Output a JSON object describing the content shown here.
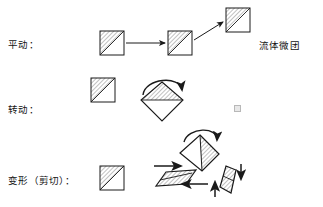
{
  "figure": {
    "type": "diagram",
    "background_color": "#ffffff",
    "stroke_color": "#1a1a1a",
    "hatch_color": "#8c8c8c"
  },
  "labels": {
    "translation": "平动：",
    "rotation": "转动：",
    "deformation": "变形（剪切）："
  },
  "caption": {
    "fluid_element": "流体微团"
  },
  "rows": [
    {
      "id": "translation",
      "label": "平动：",
      "description": "three identical hatched squares connected left-to-right by straight arrows",
      "shapes": [
        {
          "name": "square-start",
          "kind": "square",
          "x": 100,
          "y": 31,
          "size": 24,
          "hatched_half": "upper-left"
        },
        {
          "name": "square-middle",
          "kind": "square",
          "x": 168,
          "y": 31,
          "size": 24,
          "hatched_half": "upper-left"
        },
        {
          "name": "square-end",
          "kind": "square",
          "x": 226,
          "y": 8,
          "size": 24,
          "hatched_half": "upper-left"
        }
      ],
      "arrows": [
        {
          "name": "arrow-1",
          "kind": "straight",
          "from": [
            126,
            43
          ],
          "to": [
            166,
            43
          ]
        },
        {
          "name": "arrow-2",
          "kind": "straight",
          "from": [
            194,
            40
          ],
          "to": [
            224,
            22
          ]
        }
      ]
    },
    {
      "id": "rotation",
      "label": "转动：",
      "description": "a hatched square plus a rotated diamond with a clockwise curved arrow over it",
      "shapes": [
        {
          "name": "square-reference",
          "kind": "square",
          "x": 91,
          "y": 78,
          "size": 24,
          "hatched_half": "upper-left"
        },
        {
          "name": "diamond-rotated",
          "kind": "diamond",
          "cx": 162,
          "cy": 100,
          "rx": 21,
          "ry": 21,
          "hatched_half": "upper"
        }
      ],
      "arrows": [
        {
          "name": "curved-rotation-arrow",
          "kind": "curved-clockwise",
          "span": [
            145,
            88,
            182,
            93
          ]
        }
      ]
    },
    {
      "id": "deformation",
      "label": "变形（剪切）：",
      "description": "a hatched square, a tilted diamond with curved arrow, a flattened sheared parallelogram with opposing horizontal arrows, and a narrow parallelogram with opposing vertical arrows",
      "shapes": [
        {
          "name": "square-reference",
          "kind": "square",
          "x": 100,
          "y": 166,
          "size": 24,
          "hatched_half": "upper-left"
        },
        {
          "name": "diamond-tilted",
          "kind": "diamond",
          "cx": 199,
          "cy": 152,
          "rx": 21,
          "ry": 19,
          "hatched_half": "right"
        },
        {
          "name": "parallelogram-horizontal-shear",
          "kind": "parallelogram-flat",
          "cx": 176,
          "cy": 178
        },
        {
          "name": "parallelogram-vertical-shear",
          "kind": "parallelogram-narrow",
          "cx": 227,
          "cy": 180
        }
      ],
      "arrows": [
        {
          "name": "curved-deform-arrow",
          "kind": "curved-clockwise",
          "span": [
            185,
            134,
            218,
            142
          ]
        },
        {
          "name": "shear-arrow-top-right",
          "kind": "straight",
          "from": [
            155,
            167
          ],
          "to": [
            182,
            167
          ]
        },
        {
          "name": "shear-arrow-bottom-left",
          "kind": "straight",
          "from": [
            207,
            184
          ],
          "to": [
            181,
            184
          ]
        },
        {
          "name": "shear-arrow-right-down",
          "kind": "straight",
          "from": [
            240,
            165
          ],
          "to": [
            240,
            180
          ]
        },
        {
          "name": "shear-arrow-left-up",
          "kind": "straight",
          "from": [
            214,
            196
          ],
          "to": [
            214,
            181
          ]
        }
      ]
    }
  ]
}
